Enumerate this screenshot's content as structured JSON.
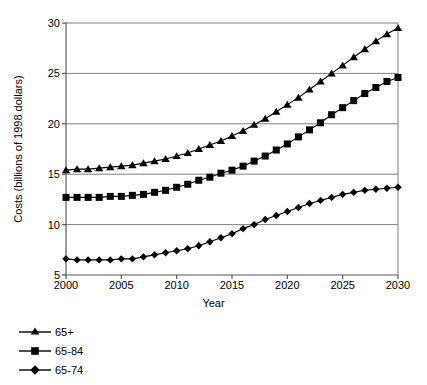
{
  "chart_data": {
    "type": "line",
    "title": "",
    "xlabel": "Year",
    "ylabel": "Costs (billions of 1998 dollars)",
    "xlim": [
      2000,
      2030
    ],
    "ylim": [
      5,
      30
    ],
    "xticks": [
      2000,
      2005,
      2010,
      2015,
      2020,
      2025,
      2030
    ],
    "yticks": [
      5,
      10,
      15,
      20,
      25,
      30
    ],
    "grid": "horizontal",
    "legend_position": "below-left",
    "x": [
      2000,
      2001,
      2002,
      2003,
      2004,
      2005,
      2006,
      2007,
      2008,
      2009,
      2010,
      2011,
      2012,
      2013,
      2014,
      2015,
      2016,
      2017,
      2018,
      2019,
      2020,
      2021,
      2022,
      2023,
      2024,
      2025,
      2026,
      2027,
      2028,
      2029,
      2030
    ],
    "series": [
      {
        "name": "65+",
        "marker": "triangle",
        "color": "#000000",
        "values": [
          15.4,
          15.5,
          15.5,
          15.6,
          15.7,
          15.8,
          15.9,
          16.1,
          16.3,
          16.5,
          16.8,
          17.1,
          17.5,
          17.9,
          18.3,
          18.8,
          19.3,
          19.9,
          20.5,
          21.2,
          21.9,
          22.6,
          23.4,
          24.2,
          25.0,
          25.8,
          26.6,
          27.4,
          28.2,
          28.9,
          29.5
        ]
      },
      {
        "name": "65-84",
        "marker": "square",
        "color": "#000000",
        "values": [
          12.7,
          12.7,
          12.7,
          12.7,
          12.8,
          12.8,
          12.9,
          13.0,
          13.2,
          13.4,
          13.7,
          14.0,
          14.4,
          14.7,
          15.1,
          15.4,
          15.8,
          16.3,
          16.8,
          17.4,
          18.0,
          18.7,
          19.4,
          20.1,
          20.9,
          21.6,
          22.3,
          23.0,
          23.6,
          24.2,
          24.6
        ]
      },
      {
        "name": "65-74",
        "marker": "diamond",
        "color": "#000000",
        "values": [
          6.6,
          6.5,
          6.5,
          6.5,
          6.5,
          6.6,
          6.6,
          6.8,
          7.0,
          7.2,
          7.4,
          7.6,
          7.9,
          8.3,
          8.7,
          9.1,
          9.6,
          10.0,
          10.5,
          10.9,
          11.3,
          11.7,
          12.1,
          12.4,
          12.7,
          13.0,
          13.2,
          13.4,
          13.5,
          13.6,
          13.7
        ]
      }
    ]
  },
  "axis": {
    "y_title": "Costs (billions of 1998 dollars)",
    "x_title": "Year",
    "y_tick_labels": [
      "30",
      "25",
      "20",
      "15",
      "10",
      "5"
    ],
    "x_tick_labels": [
      "2000",
      "2005",
      "2010",
      "2015",
      "2020",
      "2025",
      "2030"
    ]
  },
  "legend": {
    "items": [
      {
        "label": "65+",
        "marker": "triangle-marker"
      },
      {
        "label": "65-84",
        "marker": "square-marker"
      },
      {
        "label": "65-74",
        "marker": "diamond-marker"
      }
    ]
  }
}
